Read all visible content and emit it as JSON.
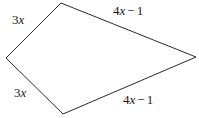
{
  "figure": {
    "kind": "quadrilateral-diagram",
    "background_color": "#ffffff",
    "stroke_color": "#2b2b2b",
    "stroke_width": 1,
    "text_color": "#1a1a1a",
    "width": 199,
    "height": 118,
    "vertices": {
      "top": {
        "x": 61,
        "y": 3
      },
      "right": {
        "x": 196,
        "y": 57
      },
      "bottom": {
        "x": 63,
        "y": 114
      },
      "left": {
        "x": 6,
        "y": 58
      }
    },
    "polygon_points": "61,3 196,57 63,114 6,58",
    "labels": {
      "top_left": {
        "coefficient": "3",
        "variable": "x",
        "operator": "",
        "constant": "",
        "text": "3x"
      },
      "top_right": {
        "coefficient": "4",
        "variable": "x",
        "operator": "−",
        "constant": "1",
        "text": "4x − 1"
      },
      "bottom_left": {
        "coefficient": "3",
        "variable": "x",
        "operator": "",
        "constant": "",
        "text": "3x"
      },
      "bottom_right": {
        "coefficient": "4",
        "variable": "x",
        "operator": "−",
        "constant": "1",
        "text": "4x − 1"
      }
    }
  }
}
